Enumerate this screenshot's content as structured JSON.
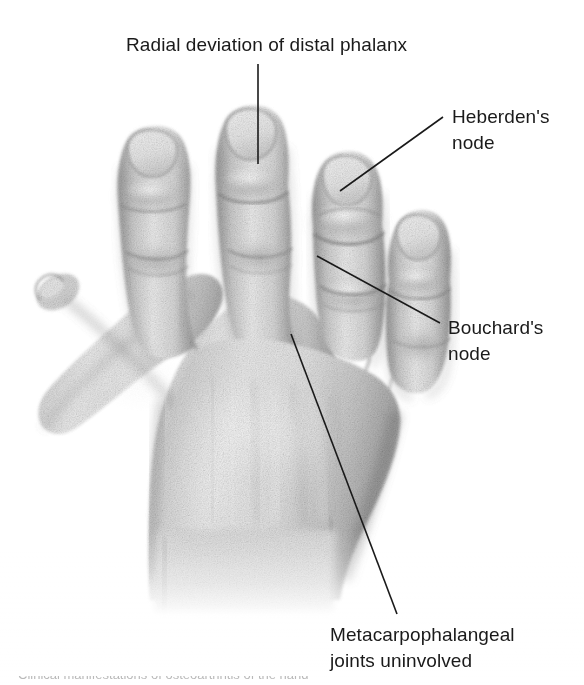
{
  "figure": {
    "background_color": "#ffffff",
    "text_color": "#1a1a1a",
    "leader_line_color": "#1a1a1a",
    "skin_tone_light": "#e4e4e4",
    "skin_tone_mid": "#c9c9c9",
    "skin_tone_dark": "#9a9a9a",
    "width": 584,
    "height": 685
  },
  "callouts": [
    {
      "id": "radial-deviation",
      "text": "Radial deviation of distal phalanx",
      "align": "center",
      "points_at": "distal phalanx of middle finger"
    },
    {
      "id": "heberden",
      "text": "Heberden's\nnode",
      "align": "left",
      "points_at": "distal interphalangeal joint of ring finger"
    },
    {
      "id": "bouchard",
      "text": "Bouchard's\nnode",
      "align": "left",
      "points_at": "proximal interphalangeal joint of ring finger"
    },
    {
      "id": "mcp",
      "text": "Metacarpophalangeal\njoints uninvolved",
      "align": "left",
      "points_at": "dorsum of hand over metacarpophalangeal joints"
    }
  ],
  "bottom_caption": {
    "text": "Clinical manifestations of osteoarthritis of the hand"
  }
}
